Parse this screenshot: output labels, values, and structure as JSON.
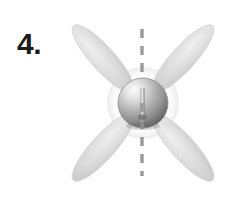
{
  "figure": {
    "label": "4.",
    "background_color": "#ffffff",
    "width": 227,
    "height": 197
  },
  "propeller": {
    "center": {
      "x": 143,
      "y": 103
    },
    "blade_count": 4,
    "blade_color": "#d9d9d9",
    "blade_edge_color": "#c2c2c2",
    "blade_length": 82,
    "blade_width": 23,
    "blade_angles_deg": [
      45,
      135,
      225,
      315
    ],
    "blades": [
      {
        "name": "blade-upper-left",
        "angle_deg": 225
      },
      {
        "name": "blade-upper-right",
        "angle_deg": 315
      },
      {
        "name": "blade-lower-left",
        "angle_deg": 135
      },
      {
        "name": "blade-lower-right",
        "angle_deg": 45
      }
    ]
  },
  "hub": {
    "name": "propeller-hub",
    "radius": 25,
    "highlight_color": "#f2f2f2",
    "mid_color": "#b0b0b0",
    "shadow_color": "#646464",
    "outline_color": "#8a8a8a"
  },
  "axis_line": {
    "name": "symmetry-axis",
    "orientation": "vertical",
    "x": 142,
    "y_start": 29,
    "y_end": 176,
    "color": "#9a9a9a",
    "dash_pattern": "9 8",
    "stroke_width": 3.4
  }
}
